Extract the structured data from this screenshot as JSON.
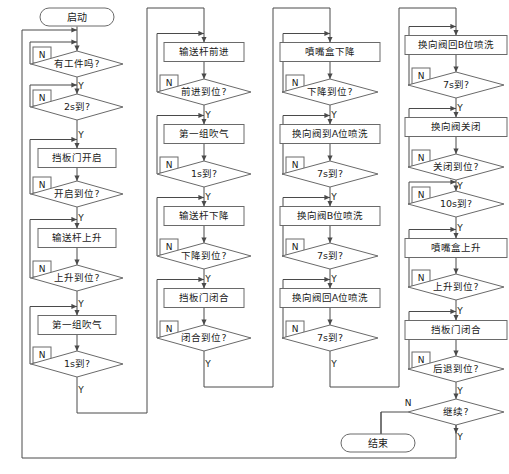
{
  "diagram": {
    "labels": {
      "yes": "Y",
      "no": "N"
    },
    "terminators": {
      "start": "启动",
      "end": "结束"
    },
    "colors": {
      "line": "#4a4a4a",
      "shape_border": "#6a6a6a",
      "fill": "#ffffff",
      "text": "#1a1a1a"
    },
    "columns": [
      {
        "id": "column-1",
        "nodes": [
          {
            "kind": "terminator",
            "text": "启动"
          },
          {
            "kind": "decision",
            "text": "有工件吗?"
          },
          {
            "kind": "decision",
            "text": "2s到?"
          },
          {
            "kind": "process",
            "text": "挡板门开启"
          },
          {
            "kind": "decision",
            "text": "开启到位?"
          },
          {
            "kind": "process",
            "text": "输送杆上升"
          },
          {
            "kind": "decision",
            "text": "上升到位?"
          },
          {
            "kind": "process",
            "text": "第一组吹气"
          },
          {
            "kind": "decision",
            "text": "1s到?"
          }
        ]
      },
      {
        "id": "column-2",
        "nodes": [
          {
            "kind": "process",
            "text": "输送杆前进"
          },
          {
            "kind": "decision",
            "text": "前进到位?"
          },
          {
            "kind": "process",
            "text": "第一组吹气"
          },
          {
            "kind": "decision",
            "text": "1s到?"
          },
          {
            "kind": "process",
            "text": "输送杆下降"
          },
          {
            "kind": "decision",
            "text": "下降到位?"
          },
          {
            "kind": "process",
            "text": "挡板门闭合"
          },
          {
            "kind": "decision",
            "text": "闭合到位?"
          }
        ]
      },
      {
        "id": "column-3",
        "nodes": [
          {
            "kind": "process",
            "text": "噴嘴盒下降"
          },
          {
            "kind": "decision",
            "text": "下降到位?"
          },
          {
            "kind": "process",
            "text": "换向阀到A位喷洗"
          },
          {
            "kind": "decision",
            "text": "7s到?"
          },
          {
            "kind": "process",
            "text": "换向阀B位喷洗"
          },
          {
            "kind": "decision",
            "text": "7s到?"
          },
          {
            "kind": "process",
            "text": "换向阀回A位喷洗"
          },
          {
            "kind": "decision",
            "text": "7s到?"
          }
        ]
      },
      {
        "id": "column-4",
        "nodes": [
          {
            "kind": "process",
            "text": "换向阀回B位喷洗"
          },
          {
            "kind": "decision",
            "text": "7s到?"
          },
          {
            "kind": "process",
            "text": "换向阀关闭"
          },
          {
            "kind": "decision",
            "text": "关闭到位?"
          },
          {
            "kind": "decision",
            "text": "10s到?"
          },
          {
            "kind": "process",
            "text": "噴嘴盒上升"
          },
          {
            "kind": "decision",
            "text": "上升到位?"
          },
          {
            "kind": "process",
            "text": "挡板门闭合"
          },
          {
            "kind": "decision",
            "text": "后退到位?"
          },
          {
            "kind": "decision",
            "text": "继续?"
          },
          {
            "kind": "terminator",
            "text": "结束"
          }
        ]
      }
    ]
  }
}
